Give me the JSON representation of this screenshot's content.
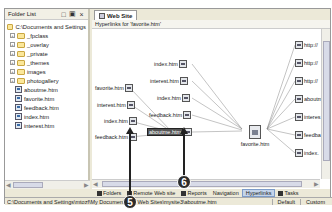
{
  "folder_list": {
    "title": "Folder List",
    "root": "C:\\Documents and Settings",
    "folders": [
      "_fpclass",
      "_overlay",
      "_private",
      "_themes",
      "images",
      "photogallery"
    ],
    "files": [
      "aboutme.htm",
      "favorite.htm",
      "feedback.htm",
      "index.htm",
      "interest.htm"
    ]
  },
  "main": {
    "tab_label": "Web Site",
    "subheader": "Hyperlinks for 'favorite.htm'"
  },
  "diagram": {
    "center": "favorite.htm",
    "incoming_top": [
      "index.htm",
      "interest.htm",
      "index.htm",
      "feedback.htm",
      "aboutme.htm"
    ],
    "incoming_left": [
      "favorite.htm",
      "interest.htm",
      "index.htm",
      "feedback.htm"
    ],
    "selected": "aboutme.htm",
    "outgoing": [
      "http://",
      "http://",
      "http://",
      "aboutm",
      "interes",
      "feedba",
      "index."
    ]
  },
  "view_tabs": [
    {
      "label": "Folders",
      "active": false
    },
    {
      "label": "Remote Web site",
      "active": false
    },
    {
      "label": "Reports",
      "active": false
    },
    {
      "label": "Navigation",
      "active": false
    },
    {
      "label": "Hyperlinks",
      "active": true
    },
    {
      "label": "Tasks",
      "active": false
    }
  ],
  "status": {
    "path": "C:\\Documents and Settings\\mtozf\\My Documents\\My Web Sites\\mysite3\\aboutme.htm",
    "mode1": "Default",
    "mode2": "Custom"
  },
  "callouts": [
    "5",
    "6"
  ]
}
